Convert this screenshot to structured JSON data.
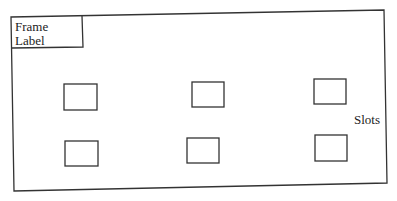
{
  "diagram": {
    "frame_label": "Frame\nLabel",
    "frame_label_lines": [
      "Frame",
      "Label"
    ],
    "slots_label": "Slots",
    "stroke_color": "#333333",
    "background": "#ffffff",
    "slot_rows": [
      {
        "slots": [
          {
            "id": "slot-1"
          },
          {
            "id": "slot-2"
          },
          {
            "id": "slot-3"
          }
        ]
      },
      {
        "slots": [
          {
            "id": "slot-4"
          },
          {
            "id": "slot-5"
          },
          {
            "id": "slot-6"
          }
        ]
      }
    ]
  }
}
